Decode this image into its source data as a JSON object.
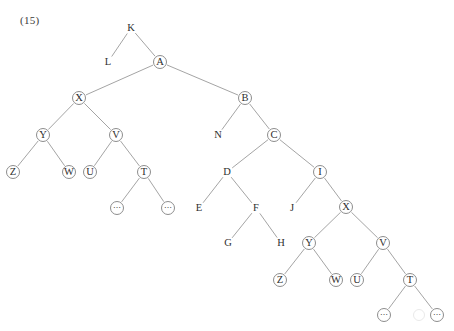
{
  "figure": {
    "number_label": "(15)",
    "label_x": 20,
    "label_y": 14,
    "width": 454,
    "height": 331,
    "line_color": "#8d8d8d",
    "text_color": "#2e2e2e",
    "background": "#ffffff",
    "type": "syntax-tree-diagram"
  },
  "nodes": [
    {
      "id": "K",
      "label": "K",
      "circled": false,
      "x": 131,
      "y": 28
    },
    {
      "id": "L",
      "label": "L",
      "circled": false,
      "x": 108,
      "y": 62
    },
    {
      "id": "A",
      "label": "A",
      "circled": true,
      "x": 160,
      "y": 62
    },
    {
      "id": "X1",
      "label": "X",
      "circled": true,
      "x": 79,
      "y": 98
    },
    {
      "id": "B",
      "label": "B",
      "circled": true,
      "x": 245,
      "y": 98
    },
    {
      "id": "Y1",
      "label": "Y",
      "circled": true,
      "x": 43,
      "y": 135
    },
    {
      "id": "V1",
      "label": "V",
      "circled": true,
      "x": 116,
      "y": 135
    },
    {
      "id": "N",
      "label": "N",
      "circled": false,
      "x": 218,
      "y": 135
    },
    {
      "id": "C",
      "label": "C",
      "circled": true,
      "x": 274,
      "y": 135
    },
    {
      "id": "Z1",
      "label": "Z",
      "circled": true,
      "x": 13,
      "y": 172
    },
    {
      "id": "W1",
      "label": "W",
      "circled": true,
      "x": 69,
      "y": 172
    },
    {
      "id": "U1",
      "label": "U",
      "circled": true,
      "x": 90,
      "y": 172
    },
    {
      "id": "T1",
      "label": "T",
      "circled": true,
      "x": 144,
      "y": 172
    },
    {
      "id": "D",
      "label": "D",
      "circled": false,
      "x": 227,
      "y": 172
    },
    {
      "id": "I",
      "label": "I",
      "circled": true,
      "x": 320,
      "y": 172
    },
    {
      "id": "DOT1",
      "label": "⋯",
      "circled": true,
      "x": 117,
      "y": 208
    },
    {
      "id": "DOT2",
      "label": "⋯",
      "circled": true,
      "x": 168,
      "y": 208
    },
    {
      "id": "E",
      "label": "E",
      "circled": false,
      "x": 199,
      "y": 208
    },
    {
      "id": "F",
      "label": "F",
      "circled": false,
      "x": 256,
      "y": 208
    },
    {
      "id": "J",
      "label": "J",
      "circled": false,
      "x": 292,
      "y": 208
    },
    {
      "id": "X2",
      "label": "X",
      "circled": true,
      "x": 346,
      "y": 207
    },
    {
      "id": "G",
      "label": "G",
      "circled": false,
      "x": 228,
      "y": 243
    },
    {
      "id": "H",
      "label": "H",
      "circled": false,
      "x": 281,
      "y": 243
    },
    {
      "id": "Y2",
      "label": "Y",
      "circled": true,
      "x": 309,
      "y": 243
    },
    {
      "id": "V2",
      "label": "V",
      "circled": true,
      "x": 383,
      "y": 243
    },
    {
      "id": "Z2",
      "label": "Z",
      "circled": true,
      "x": 280,
      "y": 280
    },
    {
      "id": "W2",
      "label": "W",
      "circled": true,
      "x": 336,
      "y": 280
    },
    {
      "id": "U2",
      "label": "U",
      "circled": true,
      "x": 357,
      "y": 280
    },
    {
      "id": "T2",
      "label": "T",
      "circled": true,
      "x": 410,
      "y": 280
    },
    {
      "id": "DOT3",
      "label": "⋯",
      "circled": true,
      "x": 384,
      "y": 315
    },
    {
      "id": "DOT4",
      "label": "⋯",
      "circled": true,
      "x": 437,
      "y": 315
    }
  ],
  "edges": [
    {
      "from": "K",
      "to": "L"
    },
    {
      "from": "K",
      "to": "A"
    },
    {
      "from": "A",
      "to": "X1"
    },
    {
      "from": "A",
      "to": "B"
    },
    {
      "from": "X1",
      "to": "Y1"
    },
    {
      "from": "X1",
      "to": "V1"
    },
    {
      "from": "Y1",
      "to": "Z1"
    },
    {
      "from": "Y1",
      "to": "W1"
    },
    {
      "from": "V1",
      "to": "U1"
    },
    {
      "from": "V1",
      "to": "T1"
    },
    {
      "from": "T1",
      "to": "DOT1"
    },
    {
      "from": "T1",
      "to": "DOT2"
    },
    {
      "from": "B",
      "to": "N"
    },
    {
      "from": "B",
      "to": "C"
    },
    {
      "from": "C",
      "to": "D"
    },
    {
      "from": "C",
      "to": "I"
    },
    {
      "from": "D",
      "to": "E"
    },
    {
      "from": "D",
      "to": "F"
    },
    {
      "from": "F",
      "to": "G"
    },
    {
      "from": "F",
      "to": "H"
    },
    {
      "from": "I",
      "to": "J"
    },
    {
      "from": "I",
      "to": "X2"
    },
    {
      "from": "X2",
      "to": "Y2"
    },
    {
      "from": "X2",
      "to": "V2"
    },
    {
      "from": "Y2",
      "to": "Z2"
    },
    {
      "from": "Y2",
      "to": "W2"
    },
    {
      "from": "V2",
      "to": "U2"
    },
    {
      "from": "V2",
      "to": "T2"
    },
    {
      "from": "T2",
      "to": "DOT3"
    },
    {
      "from": "T2",
      "to": "DOT4"
    }
  ],
  "artifacts": [
    {
      "name": "scan-smudge",
      "x": 418,
      "y": 314,
      "size": 10
    }
  ]
}
